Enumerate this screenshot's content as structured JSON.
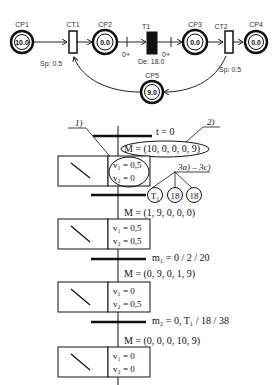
{
  "petri_net": {
    "places": [
      {
        "id": "CP1",
        "label": "CP1",
        "tokens": "10.0",
        "cx": 22,
        "cy": 42
      },
      {
        "id": "CP2",
        "label": "CP2",
        "tokens": "0.0",
        "cx": 105,
        "cy": 42
      },
      {
        "id": "CP3",
        "label": "CP3",
        "tokens": "0.0",
        "cx": 195,
        "cy": 42
      },
      {
        "id": "CP4",
        "label": "CP4",
        "tokens": "0.0",
        "cx": 256,
        "cy": 42
      },
      {
        "id": "CP5",
        "label": "CP5",
        "tokens": "9.0",
        "cx": 152,
        "cy": 92
      }
    ],
    "transitions": [
      {
        "id": "CT1",
        "label": "CT1",
        "type": "continuous",
        "param": "Sp: 0.5"
      },
      {
        "id": "T1",
        "label": "T1",
        "type": "timed",
        "param": "De: 18.0"
      },
      {
        "id": "CT2",
        "label": "CT2",
        "type": "continuous",
        "param": "Sp: 0.5"
      }
    ],
    "arc_labels": {
      "t1_in": "0+",
      "t1_out": "0+"
    }
  },
  "grafcet": {
    "annotations": {
      "a1": "1)",
      "a2": "2)",
      "a3": "3a) – 3c)"
    },
    "t0": "t = 0",
    "markings": [
      "M = (10, 0, 0, 0, 9)",
      "M = (1, 9, 0, 0, 0)",
      "M = (0, 9, 0, 1, 9)",
      "M = (0, 0, 0, 10, 9)"
    ],
    "conditions": [
      "m₁ = 0 / 2 / 20",
      "m₂ = 0, T₁ / 18 / 38"
    ],
    "steps": [
      {
        "v1": "v₁ = 0,5",
        "v2": "v₂ = 0"
      },
      {
        "v1": "v₁ = 0,5",
        "v2": "v₂ = 0,5"
      },
      {
        "v1": "v₁ = 0",
        "v2": "v₂ = 0,5"
      },
      {
        "v1": "v₁ = 0",
        "v2": "v₂ = 0"
      }
    ],
    "circles": [
      "T₁",
      "18",
      "18"
    ]
  }
}
